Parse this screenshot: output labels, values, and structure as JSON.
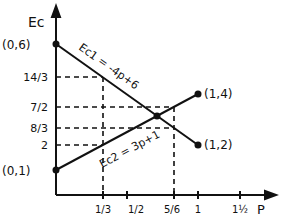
{
  "axes": {
    "y_label": "Ec",
    "x_label": "P"
  },
  "y_ticks": [
    {
      "label": "14/3",
      "value": 4.6667
    },
    {
      "label": "7/2",
      "value": 3.5
    },
    {
      "label": "8/3",
      "value": 2.6667
    },
    {
      "label": "2",
      "value": 2
    }
  ],
  "x_ticks": [
    {
      "label": "1/3",
      "value": 0.3333
    },
    {
      "label": "1/2",
      "value": 0.5
    },
    {
      "label": "5/6",
      "value": 0.8333
    },
    {
      "label": "1",
      "value": 1
    },
    {
      "label": "1½",
      "value": 1.5
    }
  ],
  "lines": {
    "ec1": {
      "equation": "Ec1 = -4p+6",
      "from": [
        0,
        6
      ],
      "to": [
        1,
        2
      ]
    },
    "ec2": {
      "equation": "Ec2 = 3p+1",
      "from": [
        0,
        1
      ],
      "to": [
        1,
        4
      ]
    }
  },
  "points": {
    "p06": "(0,6)",
    "p01": "(0,1)",
    "p14": "(1,4)",
    "p12": "(1,2)"
  },
  "intersection": {
    "p": 0.7143,
    "ec": 3.857
  }
}
